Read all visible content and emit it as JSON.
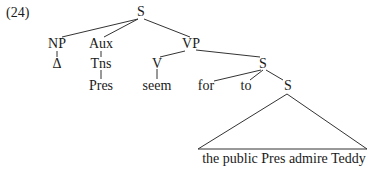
{
  "example_number": "(24)",
  "tree": {
    "nodes": {
      "root_s": "S",
      "np": "NP",
      "np_child": "Δ",
      "aux": "Aux",
      "tns": "Tns",
      "pres": "Pres",
      "vp": "VP",
      "v": "V",
      "seem": "seem",
      "s_bar": "S",
      "for": "for",
      "to": "to",
      "s_inner": "S"
    },
    "triangle_leaf": "the public Pres admire Teddy"
  },
  "colors": {
    "text": "#1a1a1a",
    "lines": "#333333",
    "background": "#ffffff"
  }
}
